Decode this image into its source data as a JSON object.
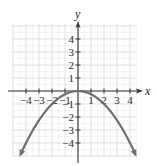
{
  "chart_data": {
    "type": "line",
    "title": "",
    "xlabel": "x",
    "ylabel": "y",
    "function": "y = -x^2/4",
    "xlim": [
      -5,
      4.5
    ],
    "ylim": [
      -5,
      5
    ],
    "grid": true,
    "legend": null,
    "x_ticks": [
      -4,
      -3,
      -2,
      -1,
      1,
      2,
      3,
      4
    ],
    "y_ticks": [
      4,
      3,
      2,
      1,
      -1,
      -2,
      -3,
      -4
    ],
    "x_tick_labels": [
      "−4",
      "−3",
      "−2",
      "−1",
      "1",
      "2",
      "3",
      "4"
    ],
    "y_tick_labels": [
      "4",
      "3",
      "2",
      "1",
      "−1",
      "−2",
      "−3",
      "−4"
    ],
    "series": [
      {
        "name": "parabola",
        "x": [
          -4.4,
          -4,
          -3,
          -2,
          -1,
          0,
          1,
          2,
          3,
          4,
          4.4
        ],
        "y": [
          -4.84,
          -4,
          -2.25,
          -1,
          -0.25,
          0,
          -0.25,
          -1,
          -2.25,
          -4,
          -4.84
        ],
        "arrows_at_ends": true
      }
    ],
    "vertex": [
      0,
      0
    ]
  },
  "colors": {
    "axis": "#333333",
    "grid": "#dedede",
    "curve": "#6f6f6f",
    "text": "#2a2a2a"
  }
}
